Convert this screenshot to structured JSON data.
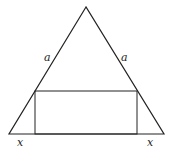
{
  "diagram": {
    "triangle": {
      "apex": [
        86,
        7
      ],
      "base_left": [
        9,
        134
      ],
      "base_right": [
        164,
        134
      ]
    },
    "rectangle": {
      "x1": 35,
      "x2": 137,
      "y_top": 91,
      "y_bottom": 134
    },
    "labels": {
      "left_side": "a",
      "right_side": "a",
      "bottom_left": "x",
      "bottom_right": "x"
    },
    "stroke_color": "#222222"
  }
}
